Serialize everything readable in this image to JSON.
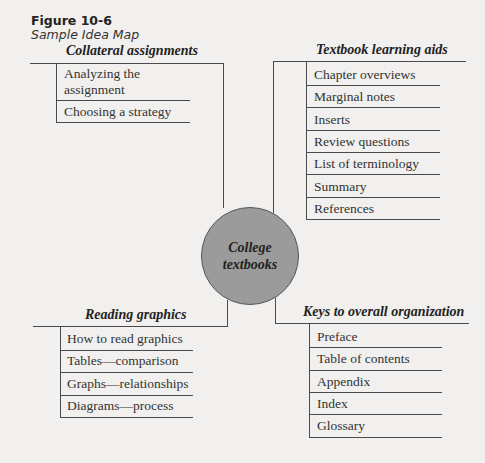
{
  "figure": {
    "label": "Figure 10-6",
    "caption": "Sample Idea Map"
  },
  "hub": {
    "line1": "College",
    "line2": "textbooks",
    "fill_color": "#9b9b9b"
  },
  "branches": {
    "top_left": {
      "title": "Collateral assignments",
      "items": [
        "Analyzing the",
        "assignment",
        "Choosing a strategy"
      ]
    },
    "top_right": {
      "title": "Textbook learning aids",
      "items": [
        "Chapter overviews",
        "Marginal notes",
        "Inserts",
        "Review questions",
        "List of terminology",
        "Summary",
        "References"
      ]
    },
    "bottom_left": {
      "title": "Reading graphics",
      "items": [
        "How to read graphics",
        "Tables—comparison",
        "Graphs—relationships",
        "Diagrams—process"
      ]
    },
    "bottom_right": {
      "title": "Keys to overall organization",
      "items": [
        "Preface",
        "Table of contents",
        "Appendix",
        "Index",
        "Glossary"
      ]
    }
  }
}
